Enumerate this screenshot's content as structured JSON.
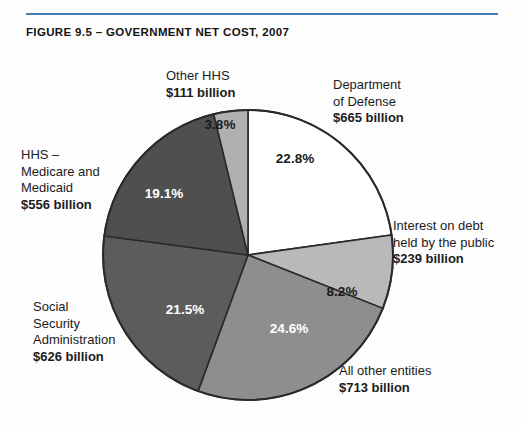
{
  "figure": {
    "title": "FIGURE 9.5 – GOVERNMENT NET COST, 2007",
    "rule_color": "#3f7fb5"
  },
  "callouts": {
    "other_hhs": {
      "l1": "Other HHS",
      "l2": "$111 billion",
      "l3": "",
      "l4": ""
    },
    "dod": {
      "l1": "Department",
      "l2": "of Defense",
      "l3": "$665 billion",
      "l4": ""
    },
    "interest": {
      "l1": "Interest on debt",
      "l2": "held by the public",
      "l3": "$239 billion",
      "l4": ""
    },
    "all_other": {
      "l1": "All other entities",
      "l2": "$713 billion",
      "l3": "",
      "l4": ""
    },
    "ssa": {
      "l1": "Social",
      "l2": "Security",
      "l3": "Administration",
      "l4": "$626 billion"
    },
    "hhs_mm": {
      "l1": "HHS –",
      "l2": "Medicare and",
      "l3": "Medicaid",
      "l4": "$556 billion"
    }
  },
  "slice_labels": {
    "dod": "22.8%",
    "interest": "8.2%",
    "all_other": "24.6%",
    "ssa": "21.5%",
    "hhs_mm": "19.1%",
    "other_hhs": "3.8%"
  },
  "chart_data": {
    "type": "pie",
    "title": "FIGURE 9.5 – GOVERNMENT NET COST, 2007",
    "xlabel": "",
    "ylabel": "",
    "legend_position": "callout-labels",
    "grid": false,
    "units": "billions of dollars",
    "start_angle_deg": 0,
    "direction": "clockwise",
    "categories": [
      "Department of Defense",
      "Interest on debt held by the public",
      "All other entities",
      "Social Security Administration",
      "HHS – Medicare and Medicaid",
      "Other HHS"
    ],
    "values": [
      665,
      239,
      713,
      626,
      556,
      111
    ],
    "percentages": [
      22.8,
      8.2,
      24.6,
      21.5,
      19.1,
      3.8
    ],
    "value_labels": [
      "$665 billion",
      "$239 billion",
      "$713 billion",
      "$626 billion",
      "$556 billion",
      "$111 billion"
    ],
    "percent_labels": [
      "22.8%",
      "8.2%",
      "24.6%",
      "21.5%",
      "19.1%",
      "3.8%"
    ],
    "colors": [
      "#ffffff",
      "#b9b9b9",
      "#8e8e8e",
      "#5c5c5c",
      "#4f4f4f",
      "#b0b0b0"
    ],
    "label_text_colors": [
      "#1a1a1a",
      "#1a1a1a",
      "#ffffff",
      "#ffffff",
      "#ffffff",
      "#1a1a1a"
    ],
    "slice_outline_color": "#2a2a2a",
    "total_value": 2910
  }
}
